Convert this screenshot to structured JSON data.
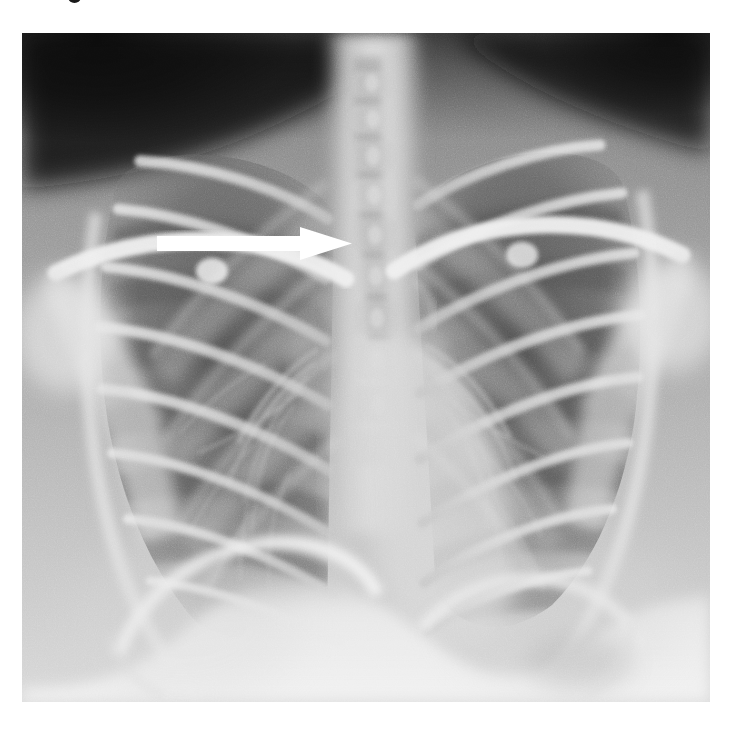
{
  "document": {
    "type": "medical-radiograph",
    "modality": "X-ray",
    "view": "PA chest",
    "background_color": "#ffffff"
  },
  "caption_remnant": {
    "description": "bottom sliver of cropped caption text above the figure",
    "color": "#1a1a1a"
  },
  "figure": {
    "name": "chest-radiograph",
    "x": 22,
    "y": 33,
    "width": 688,
    "height": 669,
    "base_tone": "#8e8e8e",
    "corner_tone_dark": "#101010",
    "lung_tone": "#6a6a6a",
    "bone_tone": "#e2e2e2",
    "mediastinum_tone": "#d2d2d2",
    "diaphragm_tone": "#eaeaea"
  },
  "annotation": {
    "name": "pointer-arrow",
    "shape": "right-pointing-arrow",
    "color": "#ffffff",
    "shaft": {
      "x1": 157,
      "y1": 236,
      "x2": 302,
      "y2": 251
    },
    "head": {
      "base_x": 300,
      "tip_x": 352,
      "top_y": 227,
      "bottom_y": 260
    },
    "points_to": "superior mediastinum / right paratracheal region"
  },
  "anatomy": {
    "structures": [
      "right clavicle",
      "left clavicle",
      "right scapula",
      "left scapula",
      "thoracic spine",
      "trachea",
      "right lung field",
      "left lung field",
      "posterior ribs",
      "anterior ribs",
      "cardiac silhouette",
      "right hemidiaphragm",
      "left hemidiaphragm",
      "gastric bubble",
      "right costophrenic angle",
      "left costophrenic angle",
      "pulmonary hila"
    ]
  }
}
